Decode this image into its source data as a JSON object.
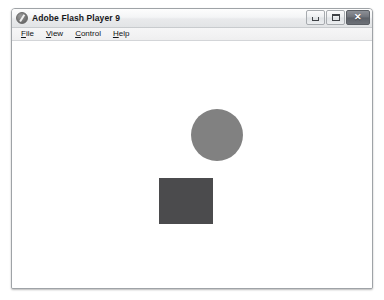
{
  "window": {
    "title": "Adobe Flash Player 9",
    "icon": "flash-player-icon",
    "controls": [
      {
        "name": "minimize",
        "label": "–",
        "glyph": "minimize-glyph"
      },
      {
        "name": "maximize",
        "label": "□",
        "glyph": "maximize-glyph"
      },
      {
        "name": "close",
        "label": "✕",
        "glyph": "close-glyph"
      }
    ]
  },
  "menubar": {
    "items": [
      {
        "name": "file",
        "accel": "F",
        "rest": "ile"
      },
      {
        "name": "view",
        "accel": "V",
        "rest": "iew"
      },
      {
        "name": "control",
        "accel": "C",
        "rest": "ontrol"
      },
      {
        "name": "help",
        "accel": "H",
        "rest": "elp"
      }
    ]
  },
  "stage": {
    "background": "#ffffff",
    "shapes": [
      {
        "name": "circle",
        "type": "circle",
        "color": "#818181",
        "x": 179,
        "y": 67,
        "width": 52,
        "height": 52
      },
      {
        "name": "square",
        "type": "rectangle",
        "color": "#4b4b4d",
        "x": 147,
        "y": 136,
        "width": 54,
        "height": 46
      }
    ]
  }
}
